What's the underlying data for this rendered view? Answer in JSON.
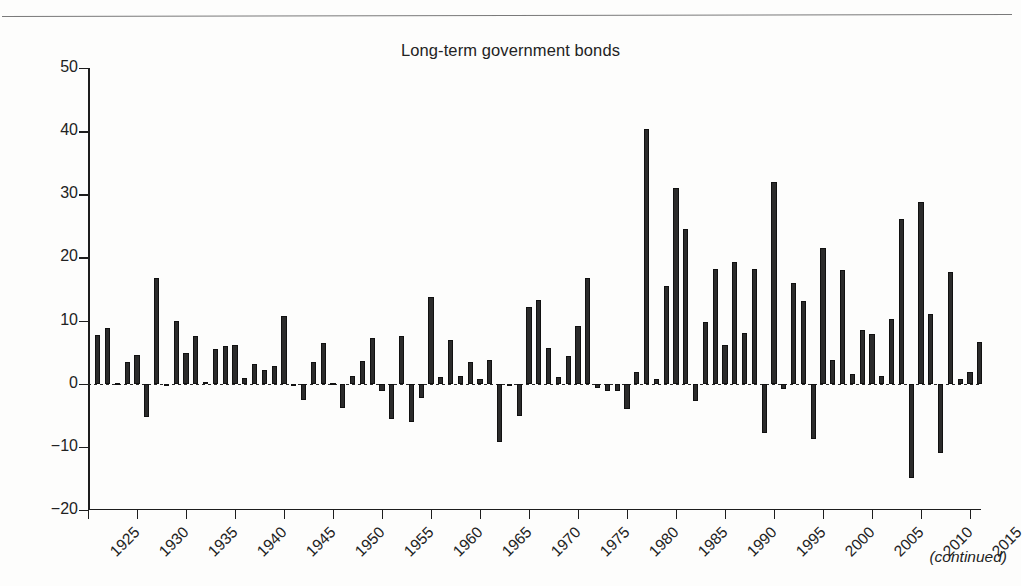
{
  "page": {
    "footnote": "(continued)"
  },
  "chart_data": {
    "type": "bar",
    "title": "Long-term government bonds",
    "xlabel": "",
    "ylabel": "",
    "ylim": [
      -20,
      50
    ],
    "ytick_labels": [
      "50",
      "40",
      "30",
      "20",
      "10",
      "0",
      "−10",
      "−20"
    ],
    "yticks": [
      50,
      40,
      30,
      20,
      10,
      0,
      -10,
      -20
    ],
    "xtick_labels": [
      "1925",
      "1930",
      "1935",
      "1940",
      "1945",
      "1950",
      "1955",
      "1960",
      "1965",
      "1970",
      "1975",
      "1980",
      "1985",
      "1990",
      "1995",
      "2000",
      "2005",
      "2010",
      "2015"
    ],
    "xticks": [
      1925,
      1930,
      1935,
      1940,
      1945,
      1950,
      1955,
      1960,
      1965,
      1970,
      1975,
      1980,
      1985,
      1990,
      1995,
      2000,
      2005,
      2010,
      2015
    ],
    "xlim": [
      1924.5,
      1917.5
    ],
    "grid": false,
    "legend": null,
    "bar_color": "#2b2b2b",
    "categories": [
      1926,
      1927,
      1928,
      1929,
      1930,
      1931,
      1932,
      1933,
      1934,
      1935,
      1936,
      1937,
      1938,
      1939,
      1940,
      1941,
      1942,
      1943,
      1944,
      1945,
      1946,
      1947,
      1948,
      1949,
      1950,
      1951,
      1952,
      1953,
      1954,
      1955,
      1956,
      1957,
      1958,
      1959,
      1960,
      1961,
      1962,
      1963,
      1964,
      1965,
      1966,
      1967,
      1968,
      1969,
      1970,
      1971,
      1972,
      1973,
      1974,
      1975,
      1976,
      1977,
      1978,
      1979,
      1980,
      1981,
      1982,
      1983,
      1984,
      1985,
      1986,
      1987,
      1988,
      1989,
      1990,
      1991,
      1992,
      1993,
      1994,
      1995,
      1996,
      1997,
      1998,
      1999,
      2000,
      2001,
      2002,
      2003,
      2004,
      2005,
      2006,
      2007,
      2008,
      2009,
      2010,
      2011,
      2012,
      2013,
      2014,
      2015,
      2016
    ],
    "values": [
      7.7,
      8.9,
      0.1,
      3.4,
      4.5,
      -5.3,
      16.8,
      -0.1,
      10.0,
      4.9,
      7.5,
      0.2,
      5.5,
      5.9,
      6.1,
      0.9,
      3.2,
      2.1,
      2.8,
      10.7,
      -0.1,
      -2.6,
      3.4,
      6.5,
      0.1,
      -3.9,
      1.2,
      3.6,
      7.2,
      -1.2,
      -5.6,
      7.5,
      -6.1,
      -2.3,
      13.8,
      1.0,
      6.9,
      1.2,
      3.5,
      0.7,
      3.7,
      -9.2,
      -0.3,
      -5.1,
      12.1,
      13.2,
      5.7,
      1.1,
      4.4,
      9.2,
      16.8,
      -0.7,
      -1.2,
      -1.2,
      -4.0,
      1.9,
      40.4,
      0.7,
      15.5,
      31.0,
      24.5,
      -2.7,
      9.7,
      18.1,
      6.2,
      19.3,
      8.1,
      18.2,
      -7.8,
      32.0,
      -0.9,
      15.9,
      13.1,
      -8.7,
      21.5,
      3.7,
      18.0,
      1.5,
      8.5,
      7.8,
      1.2,
      10.3,
      26.1,
      -14.9,
      28.8,
      11.0,
      -10.9,
      17.7,
      0.7,
      1.9,
      6.6
    ]
  }
}
